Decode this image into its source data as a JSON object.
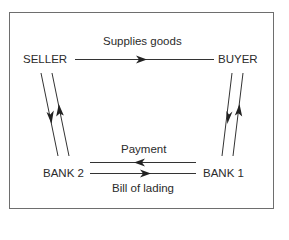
{
  "diagram": {
    "nodes": {
      "seller": "SELLER",
      "buyer": "BUYER",
      "bank1": "BANK 1",
      "bank2": "BANK 2"
    },
    "edges": {
      "supplies_goods": "Supplies goods",
      "payment": "Payment",
      "bill_of_lading": "Bill of lading"
    },
    "colors": {
      "line": "#333333",
      "frame": "#6e6e6e",
      "background": "#ffffff"
    }
  }
}
